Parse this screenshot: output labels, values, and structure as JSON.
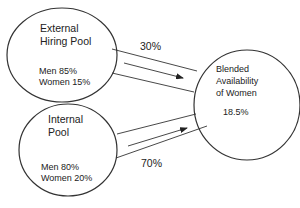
{
  "diagram": {
    "nodes": {
      "external": {
        "title_line1": "External",
        "title_line2": "Hiring Pool",
        "men": "Men 85%",
        "women": "Women 15%"
      },
      "internal": {
        "title_line1": "Internal",
        "title_line2": "Pool",
        "men": "Men 80%",
        "women": "Women 20%"
      },
      "blended": {
        "title_line1": "Blended",
        "title_line2": "Availability",
        "title_line3": "of Women",
        "value": "18.5%"
      }
    },
    "edges": {
      "external_to_blended": {
        "weight": "30%"
      },
      "internal_to_blended": {
        "weight": "70%"
      }
    },
    "colors": {
      "stroke": "#333333",
      "background": "#ffffff",
      "text": "#222222"
    }
  }
}
